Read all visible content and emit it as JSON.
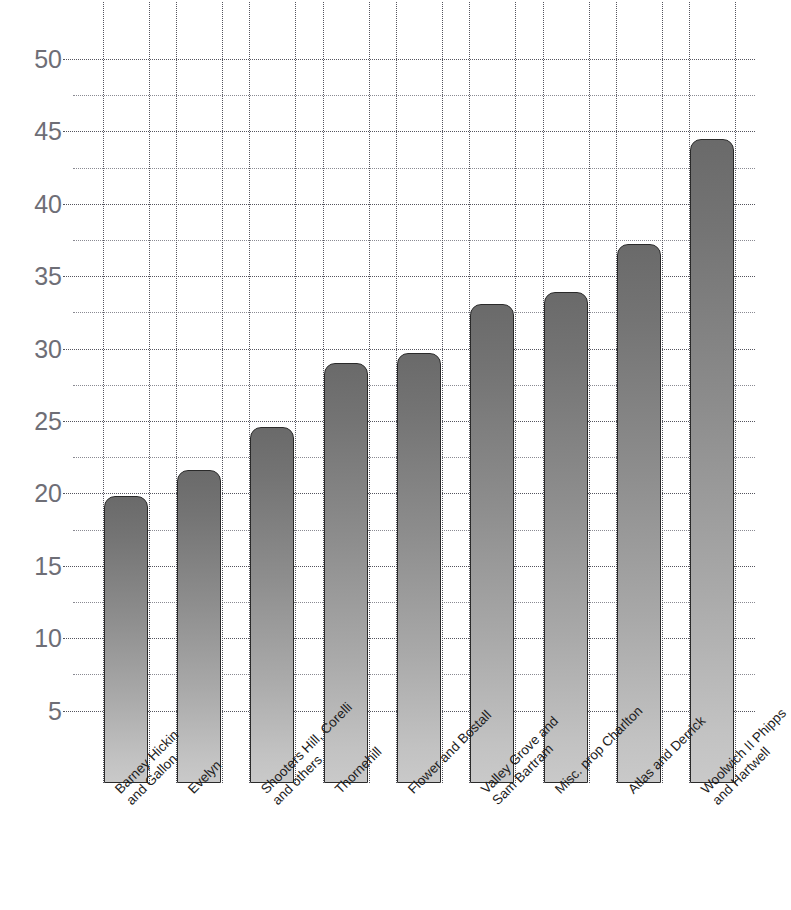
{
  "title": {
    "clipped_top_text": ""
  },
  "chart_data": {
    "type": "bar",
    "title": "",
    "subtitle": "",
    "xlabel": "",
    "ylabel": "",
    "grid": true,
    "legend": null,
    "ylim": [
      0,
      52
    ],
    "yticks": [
      5,
      10,
      15,
      20,
      25,
      30,
      35,
      40,
      45,
      50
    ],
    "minor_yticks": [
      7.5,
      12.5,
      17.5,
      22.5,
      27.5,
      32.5,
      37.5,
      42.5,
      47.5
    ],
    "categories": [
      "Barney Hickin\nand Gallon",
      "Evelyn",
      "Shooters Hill, Corelli\nand others",
      "Thornehill",
      "Flower and Bostall",
      "Valley Grove and\nSam Bartram",
      "Misc. prop Charlton",
      "Atlas and Derrick",
      "Woolwich II Phipps\nand Hartwell"
    ],
    "values": [
      19.8,
      21.6,
      24.6,
      29.0,
      29.7,
      33.1,
      33.9,
      37.2,
      44.5
    ],
    "bar_style": {
      "gradient_top": "#6a6a6a",
      "gradient_bottom": "#c9c9c9",
      "outline": "#2a2a2a",
      "rounded_top": true
    },
    "axis_color": "#6e6e76",
    "grid_color": "#55555e"
  }
}
